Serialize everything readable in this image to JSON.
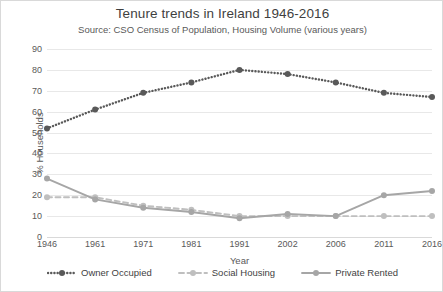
{
  "chart_data": {
    "type": "line",
    "title": "Tenure trends in Ireland 1946-2016",
    "subtitle": "Source: CSO Census of Population, Housing Volume (various years)",
    "xlabel": "Year",
    "ylabel": "% Households",
    "categories": [
      "1946",
      "1961",
      "1971",
      "1981",
      "1991",
      "2002",
      "2006",
      "2011",
      "2016"
    ],
    "yticks": [
      "0",
      "10",
      "20",
      "30",
      "40",
      "50",
      "60",
      "70",
      "80",
      "90"
    ],
    "ylim": [
      0,
      90
    ],
    "grid": true,
    "legend_position": "bottom",
    "series": [
      {
        "name": "Owner Occupied",
        "values": [
          52,
          61,
          69,
          74,
          80,
          78,
          74,
          69,
          67
        ],
        "color": "#595959",
        "style": "dotted"
      },
      {
        "name": "Social Housing",
        "values": [
          19,
          19,
          15,
          13,
          10,
          10,
          10,
          10,
          10
        ],
        "color": "#bfbfbf",
        "style": "dashed"
      },
      {
        "name": "Private Rented",
        "values": [
          28,
          18,
          14,
          12,
          9,
          11,
          10,
          20,
          22
        ],
        "color": "#a6a6a6",
        "style": "solid"
      }
    ]
  },
  "colors": {
    "owner_occupied": "#595959",
    "social_housing": "#bfbfbf",
    "private_rented": "#a6a6a6",
    "gridline": "#e8e8e8",
    "text": "#404040",
    "background": "#ffffff"
  }
}
